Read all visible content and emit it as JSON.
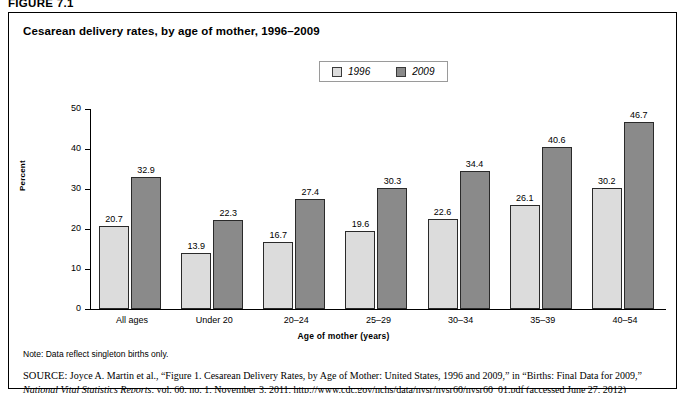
{
  "figure": {
    "number_label": "FIGURE 7.1",
    "title": "Cesarean delivery rates, by age of mother, 1996–2009"
  },
  "legend": {
    "entries": [
      {
        "label": "1996",
        "color": "#dcdcdc"
      },
      {
        "label": "2009",
        "color": "#8a8a8a"
      }
    ]
  },
  "axes": {
    "y_title": "Percent",
    "x_title": "Age of mother (years)",
    "y_ticks": [
      "0",
      "10",
      "20",
      "30",
      "40",
      "50"
    ]
  },
  "footer": {
    "note": "Note: Data reflect singleton births only.",
    "source_tag": "SOURCE:",
    "source_text_1": " Joyce A. Martin et al., “Figure 1. Cesarean Delivery Rates, by Age of Mother: United States, 1996 and 2009,” in “Births: Final Data for 2009,” ",
    "source_italic": "National Vital Statistics Reports",
    "source_text_2": ", vol. 60, no. 1, November 3, 2011, http://www.cdc.gov/nchs/data/nvsr/nvsr60/nvsr60_01.pdf (accessed June 27, 2012)"
  },
  "chart_data": {
    "type": "bar",
    "title": "Cesarean delivery rates, by age of mother, 1996–2009",
    "xlabel": "Age of mother (years)",
    "ylabel": "Percent",
    "ylim": [
      0,
      50
    ],
    "yticks": [
      0,
      10,
      20,
      30,
      40,
      50
    ],
    "grid": false,
    "legend_position": "top-center",
    "categories": [
      "All ages",
      "Under 20",
      "20–24",
      "25–29",
      "30–34",
      "35–39",
      "40–54"
    ],
    "series": [
      {
        "name": "1996",
        "color": "#dcdcdc",
        "values": [
          20.7,
          13.9,
          16.7,
          19.6,
          22.6,
          26.1,
          30.2
        ],
        "labels": [
          "20.7",
          "13.9",
          "16.7",
          "19.6",
          "22.6",
          "26.1",
          "30.2"
        ]
      },
      {
        "name": "2009",
        "color": "#8a8a8a",
        "values": [
          32.9,
          22.3,
          27.4,
          30.3,
          34.4,
          40.6,
          46.7
        ],
        "labels": [
          "32.9",
          "22.3",
          "27.4",
          "30.3",
          "34.4",
          "40.6",
          "46.7"
        ]
      }
    ]
  }
}
